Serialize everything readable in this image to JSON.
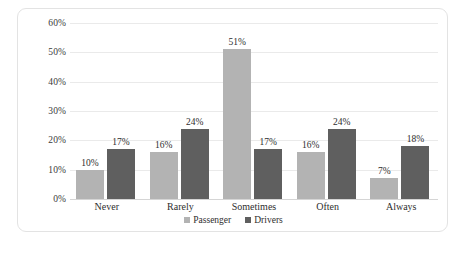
{
  "chart_data": {
    "type": "bar",
    "title": "",
    "subtitle": "",
    "xlabel": "",
    "ylabel": "",
    "categories": [
      "Never",
      "Rarely",
      "Sometimes",
      "Often",
      "Always"
    ],
    "series": [
      {
        "name": "Passenger",
        "color": "#b3b3b3",
        "values": [
          10,
          16,
          51,
          16,
          7
        ],
        "labels": [
          "10%",
          "16%",
          "51%",
          "16%",
          "7%"
        ]
      },
      {
        "name": "Drivers",
        "color": "#5f5f5f",
        "values": [
          17,
          24,
          17,
          24,
          18
        ],
        "labels": [
          "17%",
          "24%",
          "17%",
          "24%",
          "18%"
        ]
      }
    ],
    "ylim": [
      0,
      60
    ],
    "ytick_values": [
      0,
      10,
      20,
      30,
      40,
      50,
      60
    ],
    "ytick_labels": [
      "0%",
      "10%",
      "20%",
      "30%",
      "40%",
      "50%",
      "60%"
    ],
    "grid": true,
    "legend_position": "bottom",
    "value_labels": true,
    "background_color": "#ffffff",
    "gridline_color": "#eaeaea",
    "border_color": "#e3e3e3"
  }
}
